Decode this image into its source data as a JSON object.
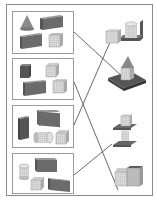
{
  "diagram": {
    "type": "matching-exercise",
    "colors": {
      "frame": "#8a8a8a",
      "box_border": "#9a9a9a",
      "line": "#5a5a5a",
      "dark_block": "#6b6b6b",
      "light_block": "#d4d4d4",
      "mid_block": "#b8b8b8"
    },
    "left_sets": [
      {
        "id": "set-1",
        "pieces": [
          "cone",
          "long-dark-prism",
          "long-dark-prism",
          "light-cube"
        ]
      },
      {
        "id": "set-2",
        "pieces": [
          "dark-cube",
          "light-cube",
          "long-dark-prism",
          "light-cube"
        ]
      },
      {
        "id": "set-3",
        "pieces": [
          "tall-dark-prism",
          "long-dark-prism",
          "lying-cylinder",
          "light-cube"
        ]
      },
      {
        "id": "set-4",
        "pieces": [
          "cylinder",
          "long-dark-prism",
          "light-cube",
          "long-dark-prism"
        ]
      }
    ],
    "right_figures": [
      {
        "id": "figure-1",
        "description": "cube and cylinder on L-shaped base"
      },
      {
        "id": "figure-2",
        "description": "cone on cube on square slab"
      },
      {
        "id": "figure-3",
        "description": "cube on plate on cylinder on plate"
      },
      {
        "id": "figure-4",
        "description": "two cubes side by side with raised back"
      }
    ],
    "connections": [
      {
        "from": "set-1",
        "to": "figure-2"
      },
      {
        "from": "set-2",
        "to": "figure-4"
      },
      {
        "from": "set-3",
        "to": "figure-1"
      },
      {
        "from": "set-4",
        "to": "figure-3"
      }
    ]
  }
}
